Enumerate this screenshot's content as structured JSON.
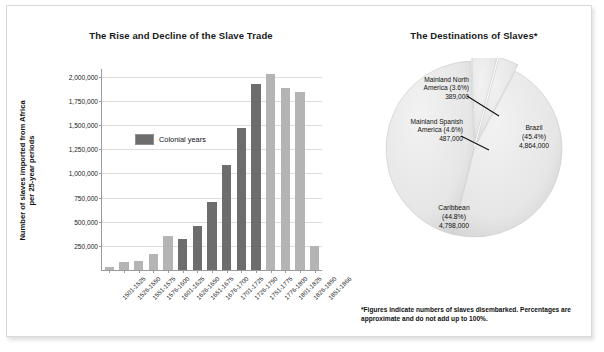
{
  "bar_chart": {
    "title": "The Rise and Decline of the Slave Trade",
    "ylabel": "Number of slaves imported from Africa\nper 25-year periods",
    "legend_label": "Colonial years"
  },
  "pie_chart": {
    "title": "The Destinations of Slaves*",
    "footnote": "*Figures indicate numbers of slaves disembarked. Percentages are approximate and do not add up to 100%.",
    "annotations": [
      {
        "name": "Mainland North America",
        "percent": "(3.6%)",
        "value": "389,000"
      },
      {
        "name": "Mainland Spanish America",
        "percent": "(4.6%)",
        "value": "487,000"
      }
    ],
    "inside_labels": [
      {
        "name": "Brazil",
        "percent": "(45.4%)",
        "value": "4,864,000"
      },
      {
        "name": "Caribbean",
        "percent": "(44.8%)",
        "value": "4,798,000"
      }
    ]
  },
  "chart_data": [
    {
      "type": "bar",
      "title": "The Rise and Decline of the Slave Trade",
      "xlabel": "",
      "ylabel": "Number of slaves imported from Africa per 25-year periods",
      "ylim": [
        0,
        2000000
      ],
      "ytick_labels": [
        "250,000",
        "500,000",
        "750,000",
        "1,000,000",
        "1,250,000",
        "1,500,000",
        "1,750,000",
        "2,000,000"
      ],
      "ytick_values": [
        250000,
        500000,
        750000,
        1000000,
        1250000,
        1500000,
        1750000,
        2000000
      ],
      "grid": true,
      "legend": {
        "position": "inside-left",
        "entries": [
          "Colonial years"
        ]
      },
      "categories": [
        "1501-1525",
        "1526-1550",
        "1551-1575",
        "1576-1600",
        "1601-1625",
        "1626-1650",
        "1651-1675",
        "1676-1700",
        "1701-1725",
        "1726-1750",
        "1751-1775",
        "1776-1800",
        "1801-1825",
        "1826-1850",
        "1851-1866"
      ],
      "values": [
        33000,
        78000,
        92000,
        167000,
        352000,
        325000,
        460000,
        700000,
        1085000,
        1465000,
        1920000,
        2025000,
        1885000,
        1840000,
        245000
      ],
      "series": [
        {
          "name": "Colonial years",
          "color": "#6d6d6d",
          "categories": [
            "1626-1650",
            "1651-1675",
            "1676-1700",
            "1701-1725",
            "1726-1750",
            "1751-1775"
          ],
          "values": [
            325000,
            460000,
            700000,
            1085000,
            1465000,
            1920000
          ]
        },
        {
          "name": "Other periods",
          "color": "#b4b4b4",
          "categories": [
            "1501-1525",
            "1526-1550",
            "1551-1575",
            "1576-1600",
            "1601-1625",
            "1776-1800",
            "1801-1825",
            "1826-1850",
            "1851-1866"
          ],
          "values": [
            33000,
            78000,
            92000,
            167000,
            352000,
            2025000,
            1885000,
            1840000,
            245000
          ]
        }
      ]
    },
    {
      "type": "pie",
      "title": "The Destinations of Slaves*",
      "labels": [
        "Brazil",
        "Caribbean",
        "Mainland Spanish America",
        "Mainland North America"
      ],
      "values": [
        4864000,
        4798000,
        487000,
        389000
      ],
      "percentages": [
        45.4,
        44.8,
        4.6,
        3.6
      ],
      "value_labels": [
        "4,864,000",
        "4,798,000",
        "487,000",
        "389,000"
      ],
      "colors": [
        "#e8e8e8",
        "#e3e3e3",
        "#dadada",
        "#e0e0e0"
      ],
      "exploded": [
        false,
        false,
        true,
        true
      ],
      "note": "*Figures indicate numbers of slaves disembarked. Percentages are approximate and do not add up to 100%."
    }
  ]
}
